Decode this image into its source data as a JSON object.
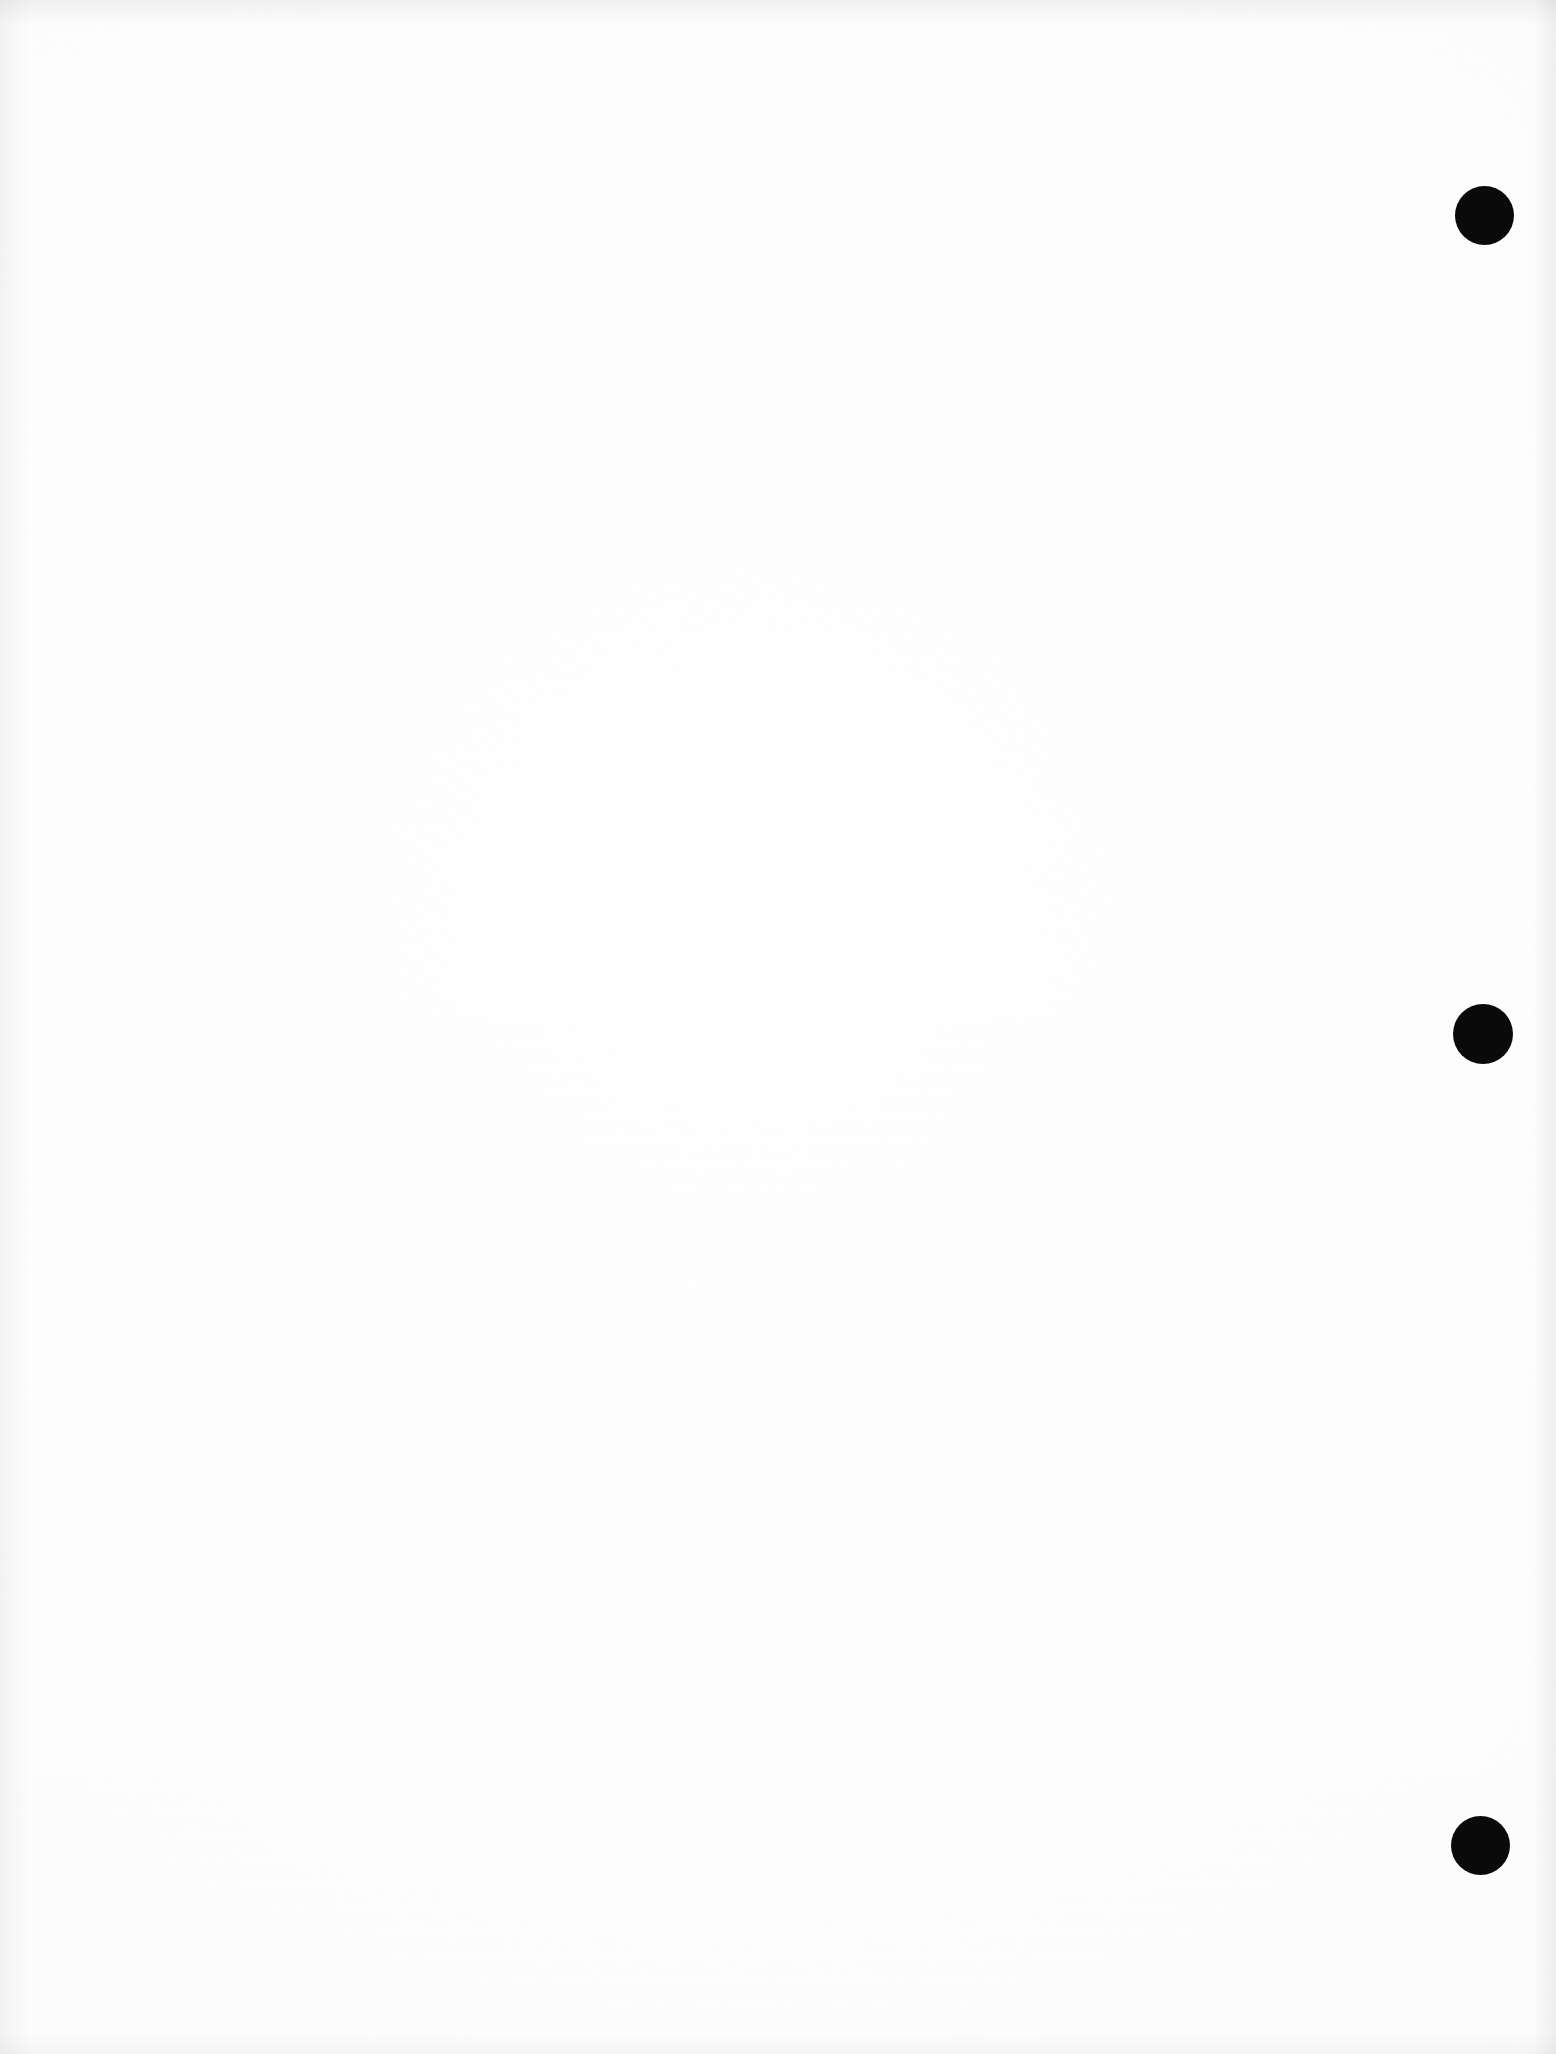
{
  "document": {
    "kind": "scanned-page",
    "page_state": "blank",
    "visible_text": "",
    "width_px": 1556,
    "height_px": 2054,
    "background_color": "#fdfdfd",
    "ink_color": "#0a0a0a"
  },
  "marks": {
    "label": "registration-dots",
    "count": 3,
    "shape": "circle",
    "color": "#0a0a0a",
    "diameter_px": 59,
    "items": [
      {
        "name": "registration-dot-top",
        "cx": 1484,
        "cy": 215,
        "d": 59
      },
      {
        "name": "registration-dot-middle",
        "cx": 1483,
        "cy": 1034,
        "d": 60
      },
      {
        "name": "registration-dot-bottom",
        "cx": 1480,
        "cy": 1845,
        "d": 59
      }
    ]
  },
  "artifacts": {
    "bleed_through": [
      {
        "name": "bleed-through-upper-left",
        "x": 150,
        "y": 380,
        "w": 700,
        "h": 280
      },
      {
        "name": "bleed-through-mid-left",
        "x": 180,
        "y": 990,
        "w": 820,
        "h": 200
      },
      {
        "name": "bleed-through-lower-left",
        "x": 280,
        "y": 1190,
        "w": 760,
        "h": 320
      },
      {
        "name": "bleed-through-lower-right",
        "x": 700,
        "y": 1300,
        "w": 660,
        "h": 240
      }
    ],
    "edges": [
      {
        "name": "scan-edge-top",
        "side": "top"
      },
      {
        "name": "scan-edge-left",
        "side": "left"
      },
      {
        "name": "scan-edge-right",
        "side": "right"
      },
      {
        "name": "scan-edge-bottom",
        "side": "bottom"
      }
    ]
  }
}
